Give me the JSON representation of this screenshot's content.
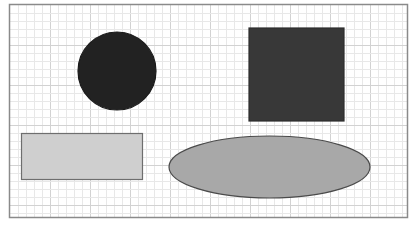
{
  "canvas": {
    "width": 413,
    "height": 225,
    "background": "#ffffff",
    "frame": {
      "x": 9.5,
      "y": 4.5,
      "width": 398,
      "height": 213,
      "stroke": "#8a8a8a",
      "stroke_width": 1.5
    },
    "grid": {
      "minor_spacing": 8,
      "major_spacing": 40,
      "minor_color": "#e8e8e8",
      "major_color": "#d2d2d2"
    }
  },
  "shapes": [
    {
      "id": "circle",
      "type": "circle",
      "cx": 117,
      "cy": 71,
      "r": 39,
      "fill": "#222222",
      "stroke": "#1a1a1a"
    },
    {
      "id": "square",
      "type": "rect",
      "x": 249,
      "y": 28,
      "width": 95,
      "height": 93,
      "fill": "#383838",
      "stroke": "#2e2e2e"
    },
    {
      "id": "rectangle",
      "type": "rect",
      "x": 21.5,
      "y": 133.5,
      "width": 121,
      "height": 46,
      "fill": "#cfcfcf",
      "stroke": "#6e6e6e"
    },
    {
      "id": "ellipse",
      "type": "ellipse",
      "cx": 269.5,
      "cy": 167,
      "rx": 100.5,
      "ry": 31,
      "fill": "#a8a8a8",
      "stroke": "#4a4a4a"
    }
  ]
}
